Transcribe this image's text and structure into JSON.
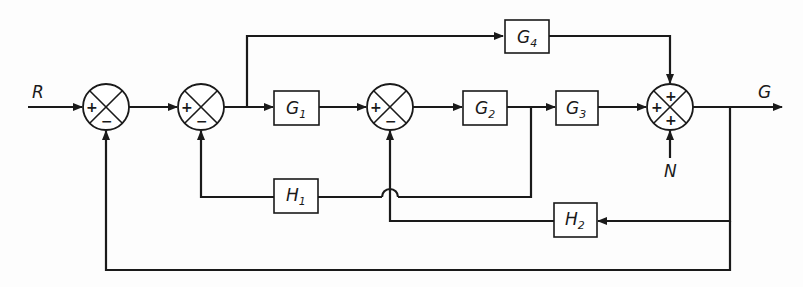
{
  "diagram": {
    "type": "control-system-block-diagram",
    "signals": {
      "input": "R",
      "output": "G",
      "disturbance": "N"
    },
    "blocks": [
      {
        "id": "G1",
        "label": "G",
        "sub": "1"
      },
      {
        "id": "G2",
        "label": "G",
        "sub": "2"
      },
      {
        "id": "G3",
        "label": "G",
        "sub": "3"
      },
      {
        "id": "G4",
        "label": "G",
        "sub": "4"
      },
      {
        "id": "H1",
        "label": "H",
        "sub": "1"
      },
      {
        "id": "H2",
        "label": "H",
        "sub": "2"
      }
    ],
    "summing_junctions": [
      {
        "id": "S1",
        "signs": {
          "left": "+",
          "bottom": "−"
        }
      },
      {
        "id": "S2",
        "signs": {
          "left": "+",
          "bottom": "−"
        }
      },
      {
        "id": "S3",
        "signs": {
          "left": "+",
          "bottom": "−"
        }
      },
      {
        "id": "S4",
        "signs": {
          "top": "+",
          "left": "+",
          "bottom": "+"
        }
      }
    ],
    "connections": [
      "R -> S1(+)",
      "S1 -> S2(+)",
      "S2 -> G1",
      "S2 -> G4 (feedforward)",
      "G1 -> S3(+)",
      "S3 -> G2",
      "G2 -> G3",
      "G2 -> H1 -> S2(−)",
      "G3 -> S4(+ left)",
      "G4 -> S4(+ top)",
      "N -> S4(+ bottom)",
      "S4 -> G (output)",
      "G -> H2 -> S3(−)",
      "G -> S1(−) (unity feedback)"
    ]
  }
}
